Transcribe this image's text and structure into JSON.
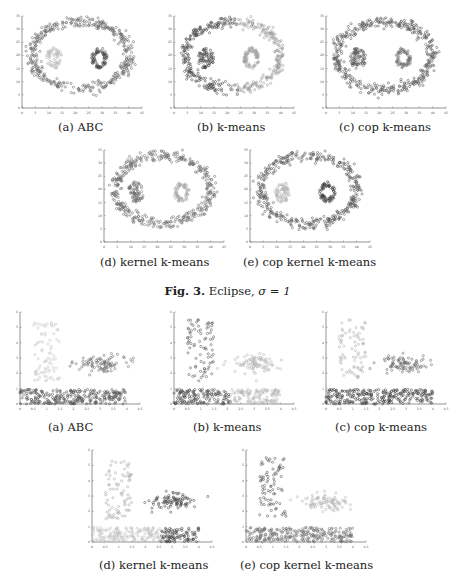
{
  "figure3": {
    "caption_label": "Fig. 3.",
    "caption_text": "Eclipse,",
    "caption_sigma": "σ = 1",
    "subfigures": [
      {
        "caption": "(a) ABC"
      },
      {
        "caption": "(b) k-means"
      },
      {
        "caption": "(c) cop k-means"
      },
      {
        "caption": "(d) kernel k-means"
      },
      {
        "caption": "(e) cop kernel k-means"
      }
    ]
  },
  "figure4": {
    "subfigures": [
      {
        "caption": "(a) ABC"
      },
      {
        "caption": "(b) k-means"
      },
      {
        "caption": "(c) cop k-means"
      },
      {
        "caption": "(d) kernel k-means"
      },
      {
        "caption": "(e) cop kernel k-means"
      }
    ]
  },
  "chart_data": [
    {
      "type": "scatter",
      "dataset": "Eclipse",
      "title": "(a) ABC",
      "xlim": [
        0,
        45
      ],
      "ylim": [
        0,
        35
      ],
      "xticks": [
        "0",
        "5",
        "10",
        "15",
        "20",
        "25",
        "30",
        "35",
        "40",
        "45"
      ],
      "yticks": [
        "0",
        "5",
        "10",
        "15",
        "20",
        "25",
        "30",
        "35"
      ],
      "clusters": [
        {
          "shape": "ring",
          "center": [
            22,
            20
          ],
          "radii": [
            18,
            13
          ],
          "n": 420,
          "shade": "#6a6a6a"
        },
        {
          "shape": "blob",
          "center": [
            12,
            19
          ],
          "radii": [
            3,
            4
          ],
          "n": 70,
          "shade": "#bdbdbd"
        },
        {
          "shape": "donut",
          "center": [
            29,
            19
          ],
          "radii": [
            3,
            4
          ],
          "n": 70,
          "shade": "#444444"
        }
      ]
    },
    {
      "type": "scatter",
      "dataset": "Eclipse",
      "title": "(b) k-means",
      "xlim": [
        0,
        45
      ],
      "ylim": [
        0,
        35
      ],
      "xticks": [
        "0",
        "5",
        "10",
        "15",
        "20",
        "25",
        "30",
        "35",
        "40",
        "45"
      ],
      "yticks": [
        "0",
        "5",
        "10",
        "15",
        "20",
        "25",
        "30",
        "35"
      ],
      "clusters": [
        {
          "shape": "ring-left",
          "center": [
            22,
            20
          ],
          "radii": [
            18,
            13
          ],
          "n": 210,
          "shade": "#4a4a4a"
        },
        {
          "shape": "ring-right",
          "center": [
            22,
            20
          ],
          "radii": [
            18,
            13
          ],
          "n": 210,
          "shade": "#9a9a9a"
        },
        {
          "shape": "blob",
          "center": [
            12,
            19
          ],
          "radii": [
            3,
            4
          ],
          "n": 70,
          "shade": "#4a4a4a"
        },
        {
          "shape": "donut",
          "center": [
            29,
            19
          ],
          "radii": [
            3,
            4
          ],
          "n": 70,
          "shade": "#9a9a9a"
        }
      ]
    },
    {
      "type": "scatter",
      "dataset": "Eclipse",
      "title": "(c) cop k-means",
      "xlim": [
        0,
        45
      ],
      "ylim": [
        0,
        35
      ],
      "xticks": [
        "0",
        "5",
        "10",
        "15",
        "20",
        "25",
        "30",
        "35",
        "40",
        "45"
      ],
      "yticks": [
        "0",
        "5",
        "10",
        "15",
        "20",
        "25",
        "30",
        "35"
      ],
      "clusters": [
        {
          "shape": "ring",
          "center": [
            22,
            20
          ],
          "radii": [
            18,
            13
          ],
          "n": 420,
          "shade": "#5a5a5a"
        },
        {
          "shape": "blob",
          "center": [
            12,
            19
          ],
          "radii": [
            3,
            4
          ],
          "n": 70,
          "shade": "#555555"
        },
        {
          "shape": "donut",
          "center": [
            29,
            19
          ],
          "radii": [
            3,
            4
          ],
          "n": 70,
          "shade": "#707070"
        }
      ]
    },
    {
      "type": "scatter",
      "dataset": "Eclipse",
      "title": "(d) kernel k-means",
      "xlim": [
        0,
        45
      ],
      "ylim": [
        0,
        35
      ],
      "xticks": [
        "0",
        "5",
        "10",
        "15",
        "20",
        "25",
        "30",
        "35",
        "40",
        "45"
      ],
      "yticks": [
        "0",
        "5",
        "10",
        "15",
        "20",
        "25",
        "30",
        "35"
      ],
      "clusters": [
        {
          "shape": "ring",
          "center": [
            22,
            20
          ],
          "radii": [
            18,
            13
          ],
          "n": 420,
          "shade": "#6e6e6e"
        },
        {
          "shape": "blob",
          "center": [
            12,
            19
          ],
          "radii": [
            3,
            4
          ],
          "n": 70,
          "shade": "#6e6e6e"
        },
        {
          "shape": "donut",
          "center": [
            29,
            19
          ],
          "radii": [
            3,
            4
          ],
          "n": 70,
          "shade": "#a8a8a8"
        }
      ]
    },
    {
      "type": "scatter",
      "dataset": "Eclipse",
      "title": "(e) cop kernel k-means",
      "xlim": [
        0,
        45
      ],
      "ylim": [
        0,
        35
      ],
      "xticks": [
        "0",
        "5",
        "10",
        "15",
        "20",
        "25",
        "30",
        "35",
        "40",
        "45"
      ],
      "yticks": [
        "0",
        "5",
        "10",
        "15",
        "20",
        "25",
        "30",
        "35"
      ],
      "clusters": [
        {
          "shape": "ring",
          "center": [
            22,
            20
          ],
          "radii": [
            18,
            13
          ],
          "n": 420,
          "shade": "#5e5e5e"
        },
        {
          "shape": "blob",
          "center": [
            12,
            19
          ],
          "radii": [
            3,
            4
          ],
          "n": 70,
          "shade": "#b4b4b4"
        },
        {
          "shape": "donut",
          "center": [
            29,
            19
          ],
          "radii": [
            3,
            4
          ],
          "n": 70,
          "shade": "#3e3e3e"
        }
      ]
    },
    {
      "type": "scatter",
      "dataset": "Three clusters",
      "title": "(a) ABC",
      "xlim": [
        0,
        4.5
      ],
      "ylim": [
        0,
        6
      ],
      "xticks": [
        "0",
        "0.5",
        "1",
        "1.5",
        "2",
        "2.5",
        "3",
        "3.5",
        "4",
        "4.5"
      ],
      "yticks": [
        "0",
        "1",
        "2",
        "3",
        "4",
        "5",
        "6"
      ],
      "clusters": [
        {
          "shape": "rect",
          "x": [
            0.5,
            1.5
          ],
          "y": [
            1.5,
            5.5
          ],
          "n": 80,
          "shade": "#c4c4c4"
        },
        {
          "shape": "gauss",
          "center": [
            3.0,
            2.6
          ],
          "sd": [
            0.45,
            0.3
          ],
          "n": 90,
          "shade": "#6e6e6e"
        },
        {
          "shape": "rect",
          "x": [
            0.0,
            4.0
          ],
          "y": [
            0.0,
            0.95
          ],
          "n": 260,
          "shade": "#505050"
        }
      ]
    },
    {
      "type": "scatter",
      "dataset": "Three clusters",
      "title": "(b) k-means",
      "xlim": [
        0,
        4.5
      ],
      "ylim": [
        0,
        6
      ],
      "xticks": [
        "0",
        "0.5",
        "1",
        "1.5",
        "2",
        "2.5",
        "3",
        "3.5",
        "4",
        "4.5"
      ],
      "yticks": [
        "0",
        "1",
        "2",
        "3",
        "4",
        "5",
        "6"
      ],
      "clusters": [
        {
          "shape": "rect",
          "x": [
            0.5,
            1.5
          ],
          "y": [
            1.5,
            5.5
          ],
          "n": 80,
          "shade": "#5a5a5a"
        },
        {
          "shape": "gauss",
          "center": [
            3.0,
            2.6
          ],
          "sd": [
            0.45,
            0.3
          ],
          "n": 90,
          "shade": "#b4b4b4"
        },
        {
          "shape": "rect",
          "x": [
            0.0,
            2.1
          ],
          "y": [
            0.0,
            0.95
          ],
          "n": 140,
          "shade": "#4a4a4a"
        },
        {
          "shape": "rect",
          "x": [
            2.1,
            4.0
          ],
          "y": [
            0.0,
            0.95
          ],
          "n": 120,
          "shade": "#b4b4b4"
        }
      ]
    },
    {
      "type": "scatter",
      "dataset": "Three clusters",
      "title": "(c) cop k-means",
      "xlim": [
        0,
        4.5
      ],
      "ylim": [
        0,
        6
      ],
      "xticks": [
        "0",
        "0.5",
        "1",
        "1.5",
        "2",
        "2.5",
        "3",
        "3.5",
        "4",
        "4.5"
      ],
      "yticks": [
        "0",
        "1",
        "2",
        "3",
        "4",
        "5",
        "6"
      ],
      "clusters": [
        {
          "shape": "rect",
          "x": [
            0.5,
            1.5
          ],
          "y": [
            1.5,
            5.5
          ],
          "n": 80,
          "shade": "#b0b0b0"
        },
        {
          "shape": "gauss",
          "center": [
            3.0,
            2.6
          ],
          "sd": [
            0.45,
            0.3
          ],
          "n": 90,
          "shade": "#6a6a6a"
        },
        {
          "shape": "rect",
          "x": [
            0.0,
            4.0
          ],
          "y": [
            0.0,
            0.95
          ],
          "n": 260,
          "shade": "#404040"
        }
      ]
    },
    {
      "type": "scatter",
      "dataset": "Three clusters",
      "title": "(d) kernel k-means",
      "xlim": [
        0,
        4.5
      ],
      "ylim": [
        0,
        6
      ],
      "xticks": [
        "0",
        "0.5",
        "1",
        "1.5",
        "2",
        "2.5",
        "3",
        "3.5",
        "4",
        "4.5"
      ],
      "yticks": [
        "0",
        "1",
        "2",
        "3",
        "4",
        "5",
        "6"
      ],
      "clusters": [
        {
          "shape": "rect",
          "x": [
            0.5,
            1.5
          ],
          "y": [
            1.5,
            5.5
          ],
          "n": 80,
          "shade": "#a8a8a8"
        },
        {
          "shape": "gauss",
          "center": [
            3.0,
            2.6
          ],
          "sd": [
            0.45,
            0.3
          ],
          "n": 90,
          "shade": "#4a4a4a"
        },
        {
          "shape": "rect",
          "x": [
            0.0,
            2.6
          ],
          "y": [
            0.0,
            0.95
          ],
          "n": 170,
          "shade": "#c0c0c0"
        },
        {
          "shape": "rect",
          "x": [
            2.6,
            4.0
          ],
          "y": [
            0.0,
            0.95
          ],
          "n": 90,
          "shade": "#404040"
        }
      ]
    },
    {
      "type": "scatter",
      "dataset": "Three clusters",
      "title": "(e) cop kernel k-means",
      "xlim": [
        0,
        4.5
      ],
      "ylim": [
        0,
        6
      ],
      "xticks": [
        "0",
        "0.5",
        "1",
        "1.5",
        "2",
        "2.5",
        "3",
        "3.5",
        "4",
        "4.5"
      ],
      "yticks": [
        "0",
        "1",
        "2",
        "3",
        "4",
        "5",
        "6"
      ],
      "clusters": [
        {
          "shape": "rect",
          "x": [
            0.5,
            1.5
          ],
          "y": [
            1.5,
            5.5
          ],
          "n": 80,
          "shade": "#555555"
        },
        {
          "shape": "gauss",
          "center": [
            3.0,
            2.6
          ],
          "sd": [
            0.45,
            0.3
          ],
          "n": 90,
          "shade": "#b4b4b4"
        },
        {
          "shape": "rect",
          "x": [
            0.0,
            4.0
          ],
          "y": [
            0.0,
            0.95
          ],
          "n": 260,
          "shade": "#6e6e6e"
        }
      ]
    }
  ]
}
